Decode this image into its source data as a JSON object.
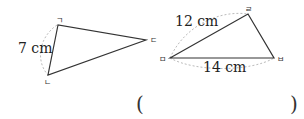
{
  "triangle1": {
    "vertices": {
      "a": "ㄱ",
      "b": "ㄴ",
      "c": "ㄷ"
    },
    "side_label": "7 cm"
  },
  "triangle2": {
    "vertices": {
      "a": "ㄹ",
      "b": "ㅁ",
      "c": "ㅂ"
    },
    "side_labels": {
      "top": "12 cm",
      "bottom": "14 cm"
    }
  },
  "answer": {
    "open": "(",
    "close": ")"
  },
  "colors": {
    "line": "#333333",
    "dashed": "#bbbbbb"
  }
}
